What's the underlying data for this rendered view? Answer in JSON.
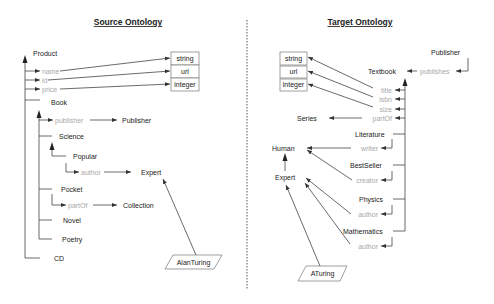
{
  "source": {
    "title": "Source Ontology",
    "classes": {
      "product": "Product",
      "book": "Book",
      "publisher": "Publisher",
      "science": "Science",
      "popular": "Popular",
      "expert": "Expert",
      "pocket": "Pocket",
      "collection": "Collection",
      "novel": "Novel",
      "poetry": "Poetry",
      "cd": "CD"
    },
    "properties": {
      "name": "name",
      "id": "id",
      "price": "price",
      "publisher": "publisher",
      "author": "author",
      "partOf": "partOf"
    },
    "datatypes": [
      "string",
      "url",
      "integer"
    ],
    "instance": "AlanTuring"
  },
  "target": {
    "title": "Target Ontology",
    "classes": {
      "publisher": "Publisher",
      "textbook": "Textbook",
      "series": "Series",
      "literature": "Literature",
      "human": "Human",
      "bestseller": "BestSeller",
      "expert": "Expert",
      "physics": "Physics",
      "mathematics": "Mathematics"
    },
    "properties": {
      "publishes": "publishes",
      "title": "title",
      "isbn": "isbn",
      "size": "size",
      "partOf": "partOf",
      "writer": "writer",
      "creator": "creator",
      "author_physics": "author",
      "author_math": "author"
    },
    "datatypes": [
      "string",
      "url",
      "integer"
    ],
    "instance": "ATuring"
  }
}
